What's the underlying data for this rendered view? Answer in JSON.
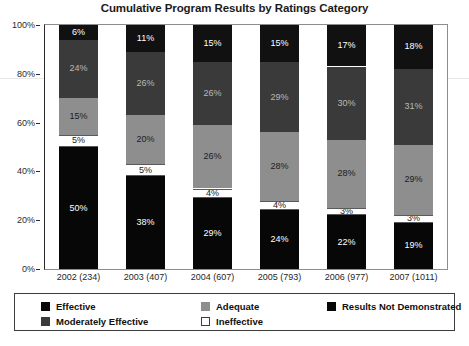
{
  "chart_data": {
    "type": "bar",
    "stacked": true,
    "title": "Cumulative Program Results by Ratings Category",
    "xlabel": "",
    "ylabel": "",
    "ylim": [
      0,
      100
    ],
    "ytick_labels": [
      "0%",
      "20%",
      "40%",
      "60%",
      "80%",
      "100%"
    ],
    "ytick_values": [
      0,
      20,
      40,
      60,
      80,
      100
    ],
    "grid": false,
    "legend_position": "bottom",
    "value_label_suffix": "%",
    "categories": [
      "2002 (234)",
      "2003 (407)",
      "2004 (607)",
      "2005 (793)",
      "2006 (977)",
      "2007 (1011)"
    ],
    "series": [
      {
        "name": "Effective",
        "color": "#070707",
        "values": [
          50,
          38,
          29,
          24,
          22,
          19
        ],
        "labels": [
          "50%",
          "38%",
          "29%",
          "24%",
          "22%",
          "19%"
        ]
      },
      {
        "name": "Ineffective",
        "color": "#ffffff",
        "values": [
          5,
          5,
          4,
          4,
          3,
          3
        ],
        "labels": [
          "5%",
          "5%",
          "4%",
          "4%",
          "3%",
          "3%"
        ]
      },
      {
        "name": "Adequate",
        "color": "#8e8e8e",
        "values": [
          15,
          20,
          26,
          28,
          28,
          29
        ],
        "labels": [
          "15%",
          "20%",
          "26%",
          "28%",
          "28%",
          "29%"
        ]
      },
      {
        "name": "Moderately Effective",
        "color": "#3a3a3a",
        "values": [
          24,
          26,
          26,
          29,
          30,
          31
        ],
        "labels": [
          "24%",
          "26%",
          "26%",
          "29%",
          "30%",
          "31%"
        ]
      },
      {
        "name": "Results Not Demonstrated",
        "color": "#111111",
        "values": [
          6,
          11,
          15,
          15,
          17,
          18
        ],
        "labels": [
          "6%",
          "11%",
          "15%",
          "15%",
          "17%",
          "18%"
        ]
      }
    ]
  },
  "legend": {
    "entries": [
      {
        "label": "Effective",
        "swatch": "effective"
      },
      {
        "label": "Adequate",
        "swatch": "adequate"
      },
      {
        "label": "Results Not Demonstrated",
        "swatch": "notdemo"
      },
      {
        "label": "Moderately Effective",
        "swatch": "moderate"
      },
      {
        "label": "Ineffective",
        "swatch": "ineffective"
      }
    ]
  }
}
